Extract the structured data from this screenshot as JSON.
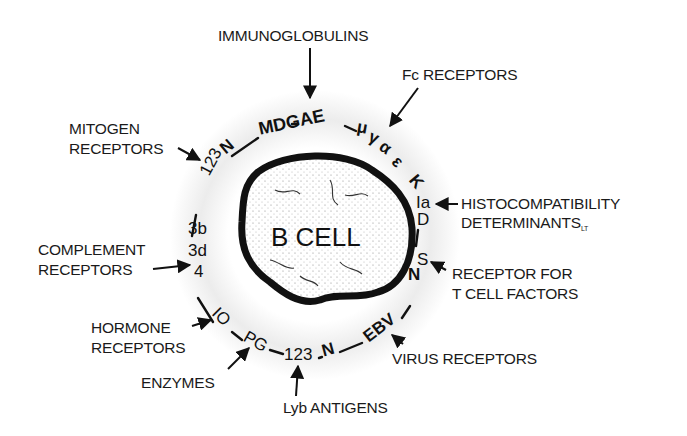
{
  "diagram": {
    "center_label": "B CELL",
    "colors": {
      "ink": "#111111",
      "background": "#ffffff",
      "cell_fill": "#f4f4f4",
      "halo": "#e6e6e6"
    },
    "callouts": [
      {
        "id": "immunoglobulins",
        "lines": [
          "IMMUNOGLOBULINS"
        ],
        "markers": "MDGAE"
      },
      {
        "id": "fc-receptors",
        "lines": [
          "Fc RECEPTORS"
        ],
        "markers": "μ γ α ε"
      },
      {
        "id": "histocompatibility",
        "lines": [
          "HISTOCOMPATIBILITY",
          "DETERMINANTS"
        ],
        "subscript": "LT",
        "markers": "K Ia D"
      },
      {
        "id": "t-cell-factor-receptor",
        "lines": [
          "RECEPTOR FOR",
          "T CELL FACTORS"
        ],
        "markers": "S N"
      },
      {
        "id": "virus-receptors",
        "lines": [
          "VIRUS RECEPTORS"
        ],
        "markers": "EBV"
      },
      {
        "id": "lyb-antigens",
        "lines": [
          "Lyb ANTIGENS"
        ],
        "markers": "1 2 3 N"
      },
      {
        "id": "enzymes",
        "lines": [
          "ENZYMES"
        ],
        "markers": "PG"
      },
      {
        "id": "hormone-receptors",
        "lines": [
          "HORMONE",
          "RECEPTORS"
        ],
        "markers": "I O"
      },
      {
        "id": "complement-receptors",
        "lines": [
          "COMPLEMENT",
          "RECEPTORS"
        ],
        "markers": "3b 3d 4"
      },
      {
        "id": "mitogen-receptors",
        "lines": [
          "MITOGEN",
          "RECEPTORS"
        ],
        "markers": "1 2 3 N"
      }
    ],
    "ring_glyphs": {
      "mdgae": "MDGAE",
      "mu": "μ",
      "gamma": "γ",
      "alpha": "α",
      "epsilon": "ε",
      "k": "K",
      "ia": "Ia",
      "d": "D",
      "s": "S",
      "n_right": "N",
      "ebv": "EBV",
      "n_bottom": "N",
      "lyb_123": "123",
      "pg": "PG",
      "io": "IO",
      "c4": "4",
      "c3d": "3d",
      "c3b": "3b",
      "mit_123": "123",
      "n_top": "N"
    }
  }
}
